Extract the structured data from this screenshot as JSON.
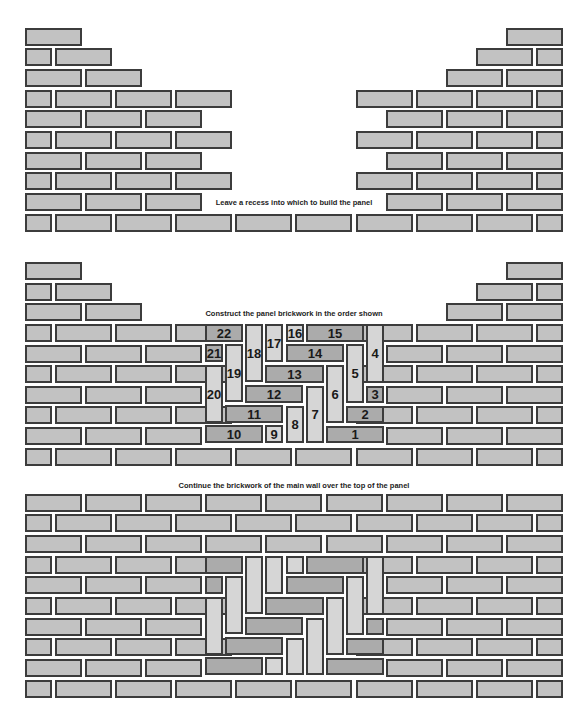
{
  "captions": {
    "step1": "Leave a recess into which to build the panel",
    "step2": "Construct the panel brickwork in the order shown",
    "step3": "Continue the brickwork of the main wall over the top of the panel"
  },
  "colors": {
    "wall_brick": "#c2c2c2",
    "panel_horizontal": "#ababab",
    "panel_vertical": "#d6d6d6",
    "mortar_outline": "#3c3c3c"
  },
  "geometry": {
    "brick_height": 18,
    "pattern_A_x": [
      [
        25,
        57
      ],
      [
        85,
        57
      ],
      [
        145,
        57
      ],
      [
        205,
        57
      ],
      [
        265,
        57
      ],
      [
        326,
        57
      ],
      [
        386,
        57
      ],
      [
        446,
        57
      ],
      [
        506,
        57
      ]
    ],
    "pattern_B_x": [
      [
        25,
        27
      ],
      [
        55,
        57
      ],
      [
        115,
        57
      ],
      [
        175,
        57
      ],
      [
        235,
        57
      ],
      [
        295,
        57
      ],
      [
        356,
        57
      ],
      [
        416,
        57
      ],
      [
        476,
        57
      ],
      [
        536,
        27
      ]
    ]
  },
  "sections": [
    {
      "name": "recess",
      "rows": [
        {
          "y": 28,
          "p": "A",
          "keep": [
            [
              0,
              1
            ],
            [
              8,
              9
            ]
          ]
        },
        {
          "y": 48,
          "p": "B",
          "keep": [
            [
              0,
              2
            ],
            [
              8,
              10
            ]
          ]
        },
        {
          "y": 69,
          "p": "A",
          "keep": [
            [
              0,
              2
            ],
            [
              7,
              9
            ]
          ]
        },
        {
          "y": 90,
          "p": "B",
          "keep": [
            [
              0,
              4
            ],
            [
              6,
              10
            ]
          ]
        },
        {
          "y": 110,
          "p": "A",
          "keep": [
            [
              0,
              3
            ],
            [
              6,
              9
            ]
          ]
        },
        {
          "y": 131,
          "p": "B",
          "keep": [
            [
              0,
              4
            ],
            [
              6,
              10
            ]
          ]
        },
        {
          "y": 152,
          "p": "A",
          "keep": [
            [
              0,
              3
            ],
            [
              6,
              9
            ]
          ]
        },
        {
          "y": 172,
          "p": "B",
          "keep": [
            [
              0,
              4
            ],
            [
              6,
              10
            ]
          ]
        },
        {
          "y": 193,
          "p": "A",
          "keep": [
            [
              0,
              3
            ],
            [
              6,
              9
            ]
          ]
        },
        {
          "y": 214,
          "p": "B",
          "keep": [
            [
              0,
              10
            ]
          ]
        }
      ]
    },
    {
      "name": "panel",
      "rows": [
        {
          "y": 262,
          "p": "A",
          "keep": [
            [
              0,
              1
            ],
            [
              8,
              9
            ]
          ]
        },
        {
          "y": 283,
          "p": "B",
          "keep": [
            [
              0,
              2
            ],
            [
              8,
              10
            ]
          ]
        },
        {
          "y": 303,
          "p": "A",
          "keep": [
            [
              0,
              2
            ],
            [
              7,
              9
            ]
          ]
        },
        {
          "y": 324,
          "p": "B",
          "keep": [
            [
              0,
              4
            ],
            [
              6,
              10
            ]
          ]
        },
        {
          "y": 345,
          "p": "A",
          "keep": [
            [
              0,
              3
            ],
            [
              6,
              9
            ]
          ]
        },
        {
          "y": 365,
          "p": "B",
          "keep": [
            [
              0,
              4
            ],
            [
              6,
              10
            ]
          ]
        },
        {
          "y": 386,
          "p": "A",
          "keep": [
            [
              0,
              3
            ],
            [
              6,
              9
            ]
          ]
        },
        {
          "y": 406,
          "p": "B",
          "keep": [
            [
              0,
              4
            ],
            [
              6,
              10
            ]
          ]
        },
        {
          "y": 427,
          "p": "A",
          "keep": [
            [
              0,
              3
            ],
            [
              6,
              9
            ]
          ]
        },
        {
          "y": 448,
          "p": "B",
          "keep": [
            [
              0,
              10
            ]
          ]
        }
      ],
      "panel_offset_y": 0,
      "show_numbers": true
    },
    {
      "name": "completed",
      "rows": [
        {
          "y": 494,
          "p": "A",
          "keep": [
            [
              0,
              9
            ]
          ]
        },
        {
          "y": 514,
          "p": "B",
          "keep": [
            [
              0,
              10
            ]
          ]
        },
        {
          "y": 535,
          "p": "A",
          "keep": [
            [
              0,
              9
            ]
          ]
        },
        {
          "y": 556,
          "p": "B",
          "keep": [
            [
              0,
              4
            ],
            [
              6,
              10
            ]
          ]
        },
        {
          "y": 576,
          "p": "A",
          "keep": [
            [
              0,
              3
            ],
            [
              6,
              9
            ]
          ]
        },
        {
          "y": 597,
          "p": "B",
          "keep": [
            [
              0,
              4
            ],
            [
              6,
              10
            ]
          ]
        },
        {
          "y": 618,
          "p": "A",
          "keep": [
            [
              0,
              3
            ],
            [
              6,
              9
            ]
          ]
        },
        {
          "y": 638,
          "p": "B",
          "keep": [
            [
              0,
              4
            ],
            [
              6,
              10
            ]
          ]
        },
        {
          "y": 659,
          "p": "A",
          "keep": [
            [
              0,
              3
            ],
            [
              6,
              9
            ]
          ]
        },
        {
          "y": 680,
          "p": "B",
          "keep": [
            [
              0,
              10
            ]
          ]
        }
      ],
      "panel_offset_y": 232,
      "show_numbers": false
    }
  ],
  "panel_bricks": [
    {
      "n": "1",
      "x": 326,
      "y": 426,
      "w": 58,
      "h": 17,
      "o": "h"
    },
    {
      "n": "2",
      "x": 346,
      "y": 406,
      "w": 38,
      "h": 17,
      "o": "h"
    },
    {
      "n": "3",
      "x": 366,
      "y": 386,
      "w": 18,
      "h": 17,
      "o": "h"
    },
    {
      "n": "4",
      "x": 366,
      "y": 324,
      "w": 18,
      "h": 59,
      "o": "v"
    },
    {
      "n": "5",
      "x": 346,
      "y": 344,
      "w": 18,
      "h": 59,
      "o": "v"
    },
    {
      "n": "6",
      "x": 326,
      "y": 365,
      "w": 18,
      "h": 58,
      "o": "v"
    },
    {
      "n": "7",
      "x": 306,
      "y": 386,
      "w": 18,
      "h": 57,
      "o": "v"
    },
    {
      "n": "8",
      "x": 286,
      "y": 406,
      "w": 18,
      "h": 37,
      "o": "v"
    },
    {
      "n": "9",
      "x": 265,
      "y": 425,
      "w": 18,
      "h": 18,
      "o": "v"
    },
    {
      "n": "10",
      "x": 205,
      "y": 425,
      "w": 58,
      "h": 18,
      "o": "h"
    },
    {
      "n": "11",
      "x": 225,
      "y": 405,
      "w": 58,
      "h": 18,
      "o": "h"
    },
    {
      "n": "12",
      "x": 245,
      "y": 385,
      "w": 58,
      "h": 18,
      "o": "h"
    },
    {
      "n": "13",
      "x": 265,
      "y": 365,
      "w": 59,
      "h": 18,
      "o": "h"
    },
    {
      "n": "14",
      "x": 286,
      "y": 344,
      "w": 58,
      "h": 18,
      "o": "h"
    },
    {
      "n": "15",
      "x": 306,
      "y": 324,
      "w": 58,
      "h": 18,
      "o": "h"
    },
    {
      "n": "16",
      "x": 286,
      "y": 324,
      "w": 18,
      "h": 18,
      "o": "v"
    },
    {
      "n": "17",
      "x": 265,
      "y": 324,
      "w": 18,
      "h": 38,
      "o": "v"
    },
    {
      "n": "18",
      "x": 245,
      "y": 324,
      "w": 18,
      "h": 58,
      "o": "v"
    },
    {
      "n": "19",
      "x": 225,
      "y": 344,
      "w": 18,
      "h": 58,
      "o": "v"
    },
    {
      "n": "20",
      "x": 205,
      "y": 365,
      "w": 18,
      "h": 58,
      "o": "v"
    },
    {
      "n": "21",
      "x": 205,
      "y": 344,
      "w": 18,
      "h": 18,
      "o": "h"
    },
    {
      "n": "22",
      "x": 205,
      "y": 324,
      "w": 38,
      "h": 18,
      "o": "h"
    }
  ]
}
